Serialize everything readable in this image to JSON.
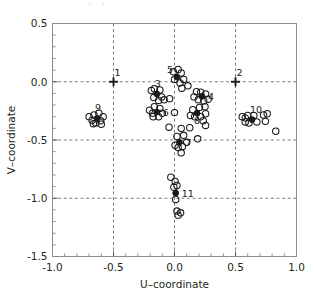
{
  "chart_data": {
    "type": "scatter",
    "title": "",
    "xlabel": "U–coordinate",
    "ylabel": "V–coordinate",
    "xlim": [
      -1.0,
      1.0
    ],
    "ylim": [
      -1.5,
      0.5
    ],
    "xticks": [
      -1.0,
      -0.5,
      0.0,
      0.5,
      1.0
    ],
    "xticklabels": [
      "-1.0",
      "-0.5",
      "0.0",
      "0.5",
      "1.0"
    ],
    "yticks": [
      0.5,
      0.0,
      -0.5,
      -1.0,
      -1.5
    ],
    "yticklabels": [
      "0.5",
      "0.0",
      "-0.5",
      "-1.0",
      "-1.5"
    ],
    "grid": true,
    "gridstyle": "dashed",
    "minor_ticks_per_interval": 5,
    "legend": "none",
    "series": [
      {
        "name": "cluster centres",
        "marker": "filled-circle",
        "points": [
          {
            "label": "3",
            "x": -0.145,
            "y": -0.105,
            "marker": "filled-circle"
          },
          {
            "label": "4",
            "x": 0.225,
            "y": -0.125,
            "marker": "filled-circle"
          },
          {
            "label": "5",
            "x": 0.02,
            "y": 0.04,
            "marker": "filled-circle"
          },
          {
            "label": "6",
            "x": -0.145,
            "y": -0.26,
            "marker": "filled-circle"
          },
          {
            "label": "7",
            "x": 0.04,
            "y": -0.52,
            "marker": "filled-circle"
          },
          {
            "label": "8",
            "x": 0.185,
            "y": -0.27,
            "marker": "filled-circle"
          },
          {
            "label": "9",
            "x": -0.635,
            "y": -0.315,
            "marker": "filled-circle"
          },
          {
            "label": "10",
            "x": 0.635,
            "y": -0.325,
            "marker": "filled-circle"
          },
          {
            "label": "11",
            "x": 0.01,
            "y": -0.955,
            "marker": "filled-circle"
          }
        ]
      },
      {
        "name": "reference markers",
        "marker": "plus",
        "points": [
          {
            "label": "1",
            "x": -0.5,
            "y": 0.0,
            "marker": "plus"
          },
          {
            "label": "2",
            "x": 0.5,
            "y": 0.0,
            "marker": "plus"
          }
        ]
      },
      {
        "name": "observations",
        "marker": "open-circle",
        "points": [
          {
            "x": -0.7,
            "y": -0.3
          },
          {
            "x": -0.675,
            "y": -0.33
          },
          {
            "x": -0.66,
            "y": -0.285
          },
          {
            "x": -0.645,
            "y": -0.355
          },
          {
            "x": -0.62,
            "y": -0.27
          },
          {
            "x": -0.605,
            "y": -0.335
          },
          {
            "x": -0.585,
            "y": -0.3
          },
          {
            "x": -0.665,
            "y": -0.36
          },
          {
            "x": -0.6,
            "y": -0.365
          },
          {
            "x": -0.19,
            "y": -0.075
          },
          {
            "x": -0.17,
            "y": -0.135
          },
          {
            "x": -0.12,
            "y": -0.07
          },
          {
            "x": -0.105,
            "y": -0.13
          },
          {
            "x": -0.165,
            "y": -0.06
          },
          {
            "x": -0.085,
            "y": -0.155
          },
          {
            "x": -0.04,
            "y": -0.145
          },
          {
            "x": -0.13,
            "y": -0.16
          },
          {
            "x": -0.205,
            "y": -0.245
          },
          {
            "x": -0.165,
            "y": -0.215
          },
          {
            "x": -0.12,
            "y": -0.23
          },
          {
            "x": -0.175,
            "y": -0.3
          },
          {
            "x": -0.13,
            "y": -0.3
          },
          {
            "x": -0.18,
            "y": -0.27
          },
          {
            "x": -0.1,
            "y": -0.27
          },
          {
            "x": -0.01,
            "y": 0.085
          },
          {
            "x": 0.03,
            "y": 0.105
          },
          {
            "x": 0.055,
            "y": 0.075
          },
          {
            "x": 0.0,
            "y": 0.02
          },
          {
            "x": 0.045,
            "y": -0.01
          },
          {
            "x": 0.075,
            "y": 0.02
          },
          {
            "x": 0.06,
            "y": -0.055
          },
          {
            "x": 0.11,
            "y": -0.035
          },
          {
            "x": 0.18,
            "y": -0.085
          },
          {
            "x": 0.215,
            "y": -0.09
          },
          {
            "x": 0.255,
            "y": -0.105
          },
          {
            "x": 0.195,
            "y": -0.155
          },
          {
            "x": 0.24,
            "y": -0.165
          },
          {
            "x": 0.275,
            "y": -0.15
          },
          {
            "x": 0.16,
            "y": -0.13
          },
          {
            "x": 0.15,
            "y": -0.24
          },
          {
            "x": 0.205,
            "y": -0.22
          },
          {
            "x": 0.25,
            "y": -0.215
          },
          {
            "x": 0.165,
            "y": -0.3
          },
          {
            "x": 0.215,
            "y": -0.3
          },
          {
            "x": 0.255,
            "y": -0.275
          },
          {
            "x": 0.235,
            "y": -0.335
          },
          {
            "x": 0.255,
            "y": -0.375
          },
          {
            "x": 0.13,
            "y": -0.29
          },
          {
            "x": 0.0,
            "y": -0.265
          },
          {
            "x": -0.045,
            "y": -0.39
          },
          {
            "x": 0.055,
            "y": -0.4
          },
          {
            "x": 0.125,
            "y": -0.395
          },
          {
            "x": 0.02,
            "y": -0.47
          },
          {
            "x": 0.075,
            "y": -0.46
          },
          {
            "x": 0.19,
            "y": -0.49
          },
          {
            "x": 0.03,
            "y": -0.565
          },
          {
            "x": 0.065,
            "y": -0.555
          },
          {
            "x": 0.005,
            "y": -0.545
          },
          {
            "x": 0.055,
            "y": -0.61
          },
          {
            "x": 0.1,
            "y": -0.52
          },
          {
            "x": 0.555,
            "y": -0.3
          },
          {
            "x": 0.58,
            "y": -0.345
          },
          {
            "x": 0.6,
            "y": -0.29
          },
          {
            "x": 0.61,
            "y": -0.355
          },
          {
            "x": 0.65,
            "y": -0.29
          },
          {
            "x": 0.675,
            "y": -0.345
          },
          {
            "x": 0.73,
            "y": -0.285
          },
          {
            "x": 0.76,
            "y": -0.275
          },
          {
            "x": 0.745,
            "y": -0.34
          },
          {
            "x": 0.83,
            "y": -0.425
          },
          {
            "x": 0.58,
            "y": -0.31
          },
          {
            "x": -0.03,
            "y": -0.82
          },
          {
            "x": 0.005,
            "y": -0.855
          },
          {
            "x": 0.02,
            "y": -0.89
          },
          {
            "x": -0.005,
            "y": -0.905
          },
          {
            "x": 0.01,
            "y": -1.01
          },
          {
            "x": 0.02,
            "y": -1.11
          },
          {
            "x": 0.05,
            "y": -1.125
          },
          {
            "x": 0.03,
            "y": -1.145
          }
        ]
      }
    ]
  },
  "figure": {
    "top_cropped_text": "·   ·"
  }
}
